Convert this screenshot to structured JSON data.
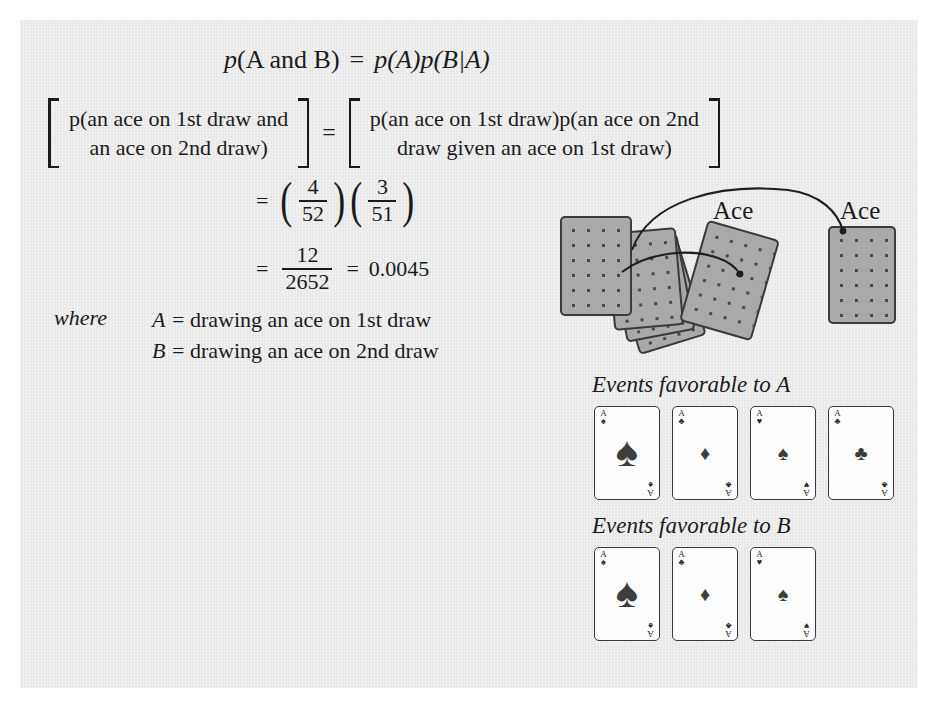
{
  "figure": {
    "background_color": "#e8e8e8",
    "ink_color": "#1b1b1b",
    "card_back_color": "#a9a9a9"
  },
  "equations": {
    "main": {
      "p_open": "p",
      "body": "(A and B)",
      "equals": "=",
      "rhs": "p(A)p(B|A)"
    },
    "bracket": {
      "left_line_1": "p(an ace on 1st draw and",
      "left_line_2": "an ace on 2nd draw)",
      "equals": "=",
      "right_line_1": "p(an ace on 1st draw)p(an ace on 2nd",
      "right_line_2": "draw given an ace on 1st draw)"
    },
    "product": {
      "equals": "=",
      "fraction_1": {
        "numerator": "4",
        "denominator": "52"
      },
      "fraction_2": {
        "numerator": "3",
        "denominator": "51"
      },
      "paren_open": "(",
      "paren_close": ")"
    },
    "final": {
      "equals_1": "=",
      "fraction": {
        "numerator": "12",
        "denominator": "2652"
      },
      "equals_2": "=",
      "result": "0.0045"
    }
  },
  "where": {
    "label": "where",
    "definitions": [
      {
        "symbol": "A",
        "equals": "=",
        "text": "drawing an ace on 1st draw"
      },
      {
        "symbol": "B",
        "equals": "=",
        "text": "drawing an ace on 2nd draw"
      }
    ]
  },
  "deck_illustration": {
    "ace_label_1": "Ace",
    "ace_label_2": "Ace",
    "deck_card_count": 4,
    "drawn_card_count": 2
  },
  "events": {
    "section_a": {
      "title": "Events favorable to A",
      "cards": [
        {
          "rank": "A",
          "suit": "spades",
          "glyph": "♠",
          "center_size": "big"
        },
        {
          "rank": "A",
          "suit": "clubs",
          "glyph": "♣",
          "center_glyph": "♦",
          "center_size": "small"
        },
        {
          "rank": "A",
          "suit": "hearts",
          "glyph": "♥",
          "center_glyph": "♠",
          "center_size": "small"
        },
        {
          "rank": "A",
          "suit": "clubs",
          "glyph": "♣",
          "center_glyph": "♣",
          "center_size": "small"
        }
      ]
    },
    "section_b": {
      "title": "Events favorable to B",
      "cards": [
        {
          "rank": "A",
          "suit": "spades",
          "glyph": "♠",
          "center_size": "big"
        },
        {
          "rank": "A",
          "suit": "clubs",
          "glyph": "♣",
          "center_glyph": "♦",
          "center_size": "small"
        },
        {
          "rank": "A",
          "suit": "hearts",
          "glyph": "♥",
          "center_glyph": "♠",
          "center_size": "small"
        }
      ]
    }
  }
}
